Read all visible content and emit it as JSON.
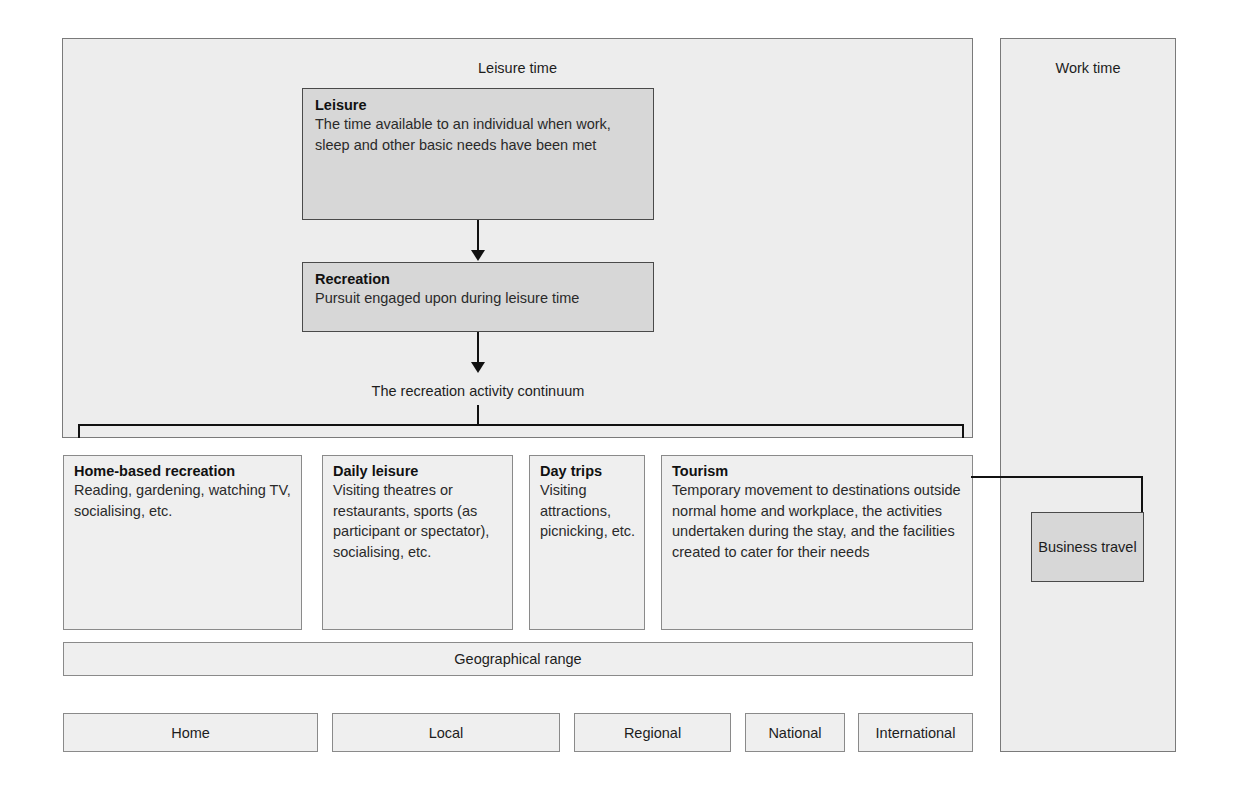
{
  "diagram": {
    "title_leisure_time": "Leisure time",
    "title_work_time": "Work time",
    "continuum_label": "The recreation activity continuum",
    "geographical_range_label": "Geographical range",
    "business_travel_label": "Business travel",
    "definitions": [
      {
        "term": "Leisure",
        "description": "The time available to an individual when work, sleep and other basic needs have been met"
      },
      {
        "term": "Recreation",
        "description": "Pursuit engaged upon during leisure time"
      }
    ],
    "continuum_columns": [
      {
        "term": "Home-based recreation",
        "description": "Reading, gardening, watching TV, socialising, etc."
      },
      {
        "term": "Daily leisure",
        "description": "Visiting theatres or restaurants, sports (as participant or spectator), socialising, etc."
      },
      {
        "term": "Day trips",
        "description": "Visiting attractions, picnicking, etc."
      },
      {
        "term": "Tourism",
        "description": "Temporary movement to destinations outside normal home and workplace, the activities undertaken during the stay, and the facilities created to cater for their needs"
      }
    ],
    "geographical_scales": [
      "Home",
      "Local",
      "Regional",
      "National",
      "International"
    ],
    "colors": {
      "page_background": "#ffffff",
      "panel_fill": "#ededed",
      "shaded_fill": "#d7d7d7",
      "box_fill": "#efefef",
      "line": "#111111",
      "border": "#6d6d6d",
      "text": "#1d1d1d"
    }
  }
}
